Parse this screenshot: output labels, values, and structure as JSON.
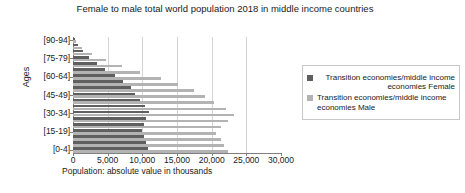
{
  "chart_data": {
    "type": "bar",
    "orientation": "horizontal",
    "title": "Female to male total world population 2018 in middle income countries",
    "xlabel": "Population: absolute value in thousands",
    "ylabel": "Ages",
    "xlim": [
      0,
      30000
    ],
    "xticks": [
      0,
      5000,
      10000,
      15000,
      20000,
      25000,
      30000
    ],
    "xtick_labels": [
      "0",
      "5,000",
      "10,000",
      "15,000",
      "20,000",
      "25,000",
      "30,000"
    ],
    "grid": true,
    "legend_position": "right",
    "categories": [
      "[0-4]",
      "[5-9]",
      "[10-14]",
      "[15-19]",
      "[20-24]",
      "[25-29]",
      "[30-34]",
      "[35-39]",
      "[40-44]",
      "[45-49]",
      "[50-54]",
      "[55-59]",
      "[60-64]",
      "[65-69]",
      "[70-74]",
      "[75-79]",
      "[80-84]",
      "[85-89]",
      "[90-94]"
    ],
    "ytick_labels": [
      "[90-94]",
      "[75-79]",
      "[60-64]",
      "[45-49]",
      "[30-34]",
      "[15-19]",
      "[0-4]"
    ],
    "series": [
      {
        "name": "Transition economies/middle income economies Female",
        "color": "#5f5f5f",
        "values": [
          10800,
          10500,
          10200,
          9900,
          10200,
          10600,
          10900,
          10400,
          9600,
          9000,
          8300,
          7200,
          6000,
          4600,
          3400,
          2300,
          1400,
          700,
          300
        ]
      },
      {
        "name": "Transition economies/middle income economies Male",
        "color": "#b3b3b3",
        "values": [
          22300,
          21800,
          21400,
          20600,
          21300,
          22400,
          23200,
          22100,
          20400,
          19100,
          17500,
          15200,
          12700,
          9700,
          7100,
          4700,
          2800,
          1300,
          500
        ]
      }
    ]
  },
  "legend": {
    "items": [
      {
        "label": "Transition economies/middle income economies Female",
        "swatch": "female"
      },
      {
        "label": "Transition economies/middle income economies Male",
        "swatch": "male"
      }
    ]
  }
}
